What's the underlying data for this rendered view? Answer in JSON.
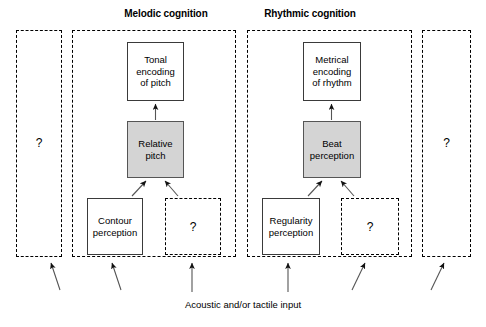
{
  "figure": {
    "caption": "Acoustic and/or tactile input",
    "columns": [
      {
        "title": "Melodic cognition"
      },
      {
        "title": "Rhythmic cognition"
      }
    ],
    "unknown_marker": "?",
    "colors": {
      "shaded_node_fill": "#d4d4d4",
      "node_border": "#3a3a3a",
      "dashed_border": "#000000",
      "text": "#000000",
      "background": "#ffffff"
    }
  },
  "regions": {
    "left_unknown": {
      "label": "?"
    },
    "melodic": {
      "label": "Melodic cognition"
    },
    "rhythmic": {
      "label": "Rhythmic cognition"
    },
    "right_unknown": {
      "label": "?"
    }
  },
  "nodes": {
    "tonal_encoding": {
      "label": "Tonal encoding of pitch",
      "line1": "Tonal",
      "line2": "encoding",
      "line3": "of pitch",
      "shaded": false
    },
    "relative_pitch": {
      "label": "Relative pitch",
      "line1": "Relative",
      "line2": "pitch",
      "shaded": true
    },
    "contour_perception": {
      "label": "Contour perception",
      "line1": "Contour",
      "line2": "perception",
      "shaded": false
    },
    "melodic_unknown": {
      "label": "?"
    },
    "metrical_encoding": {
      "label": "Metrical encoding of rhythm",
      "line1": "Metrical",
      "line2": "encoding",
      "line3": "of rhythm",
      "shaded": false
    },
    "beat_perception": {
      "label": "Beat perception",
      "line1": "Beat",
      "line2": "perception",
      "shaded": true
    },
    "regularity_perception": {
      "label": "Regularity perception",
      "line1": "Regularity",
      "line2": "perception",
      "shaded": false
    },
    "rhythmic_unknown": {
      "label": "?"
    }
  },
  "arrows": {
    "internal": [
      {
        "from": "relative_pitch",
        "to": "tonal_encoding",
        "style": "vertical"
      },
      {
        "from": "contour_perception",
        "to": "relative_pitch",
        "style": "diagonal"
      },
      {
        "from": "melodic_unknown",
        "to": "relative_pitch",
        "style": "diagonal"
      },
      {
        "from": "beat_perception",
        "to": "metrical_encoding",
        "style": "vertical"
      },
      {
        "from": "regularity_perception",
        "to": "beat_perception",
        "style": "diagonal"
      },
      {
        "from": "rhythmic_unknown",
        "to": "beat_perception",
        "style": "diagonal"
      }
    ],
    "input": [
      {
        "target": "left_unknown",
        "style": "diagonal"
      },
      {
        "target": "melodic",
        "style": "diagonal"
      },
      {
        "target": "melodic_unknown",
        "style": "vertical"
      },
      {
        "target": "rhythmic",
        "style": "vertical"
      },
      {
        "target": "rhythmic_unknown",
        "style": "diagonal"
      },
      {
        "target": "right_unknown",
        "style": "diagonal"
      }
    ]
  }
}
